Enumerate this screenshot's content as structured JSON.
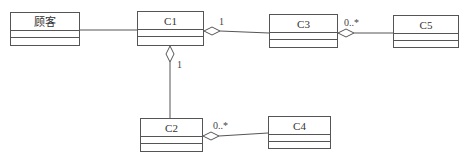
{
  "diagram": {
    "type": "uml-class-diagram",
    "classes": [
      {
        "id": "customer",
        "name": "顾客",
        "x": 10,
        "y": 12,
        "w": 70,
        "h": 34
      },
      {
        "id": "c1",
        "name": "C1",
        "x": 137,
        "y": 11,
        "w": 67,
        "h": 35
      },
      {
        "id": "c3",
        "name": "C3",
        "x": 269,
        "y": 14,
        "w": 69,
        "h": 34
      },
      {
        "id": "c5",
        "name": "C5",
        "x": 393,
        "y": 15,
        "w": 66,
        "h": 33
      },
      {
        "id": "c2",
        "name": "C2",
        "x": 140,
        "y": 118,
        "w": 63,
        "h": 34
      },
      {
        "id": "c4",
        "name": "C4",
        "x": 268,
        "y": 116,
        "w": 63,
        "h": 33
      }
    ],
    "relationships": [
      {
        "from": "customer",
        "to": "c1",
        "kind": "association"
      },
      {
        "from": "c1",
        "to": "c3",
        "kind": "aggregation",
        "diamond_at": "c1",
        "multiplicity": "1"
      },
      {
        "from": "c3",
        "to": "c5",
        "kind": "aggregation",
        "diamond_at": "c3",
        "multiplicity": "0..*"
      },
      {
        "from": "c1",
        "to": "c2",
        "kind": "aggregation",
        "diamond_at": "c1",
        "multiplicity": "1"
      },
      {
        "from": "c2",
        "to": "c4",
        "kind": "aggregation",
        "diamond_at": "c2",
        "multiplicity": "0..*"
      }
    ],
    "labels": {
      "c1_c3_mult": "1",
      "c3_c5_mult": "0..*",
      "c1_c2_mult": "1",
      "c2_c4_mult": "0..*"
    },
    "line_color": "#555555"
  }
}
